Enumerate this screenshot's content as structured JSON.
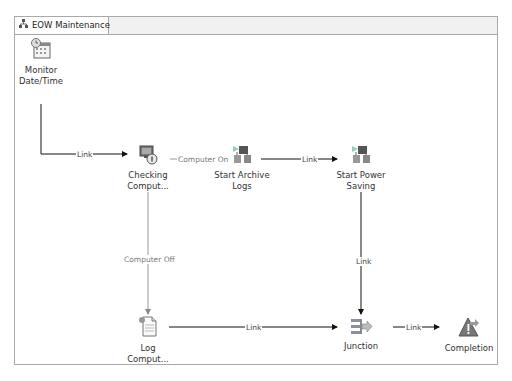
{
  "tab": {
    "title": "EOW Maintenance",
    "icon": "workflow-icon"
  },
  "nodes": [
    {
      "id": "monitor",
      "label_line1": "Monitor",
      "label_line2": "Date/Time",
      "icon": "calendar-clock-icon"
    },
    {
      "id": "checking",
      "label_line1": "Checking",
      "label_line2": "Comput...",
      "icon": "computer-check-icon"
    },
    {
      "id": "archive",
      "label_line1": "Start Archive",
      "label_line2": "Logs",
      "icon": "run-program-icon"
    },
    {
      "id": "power",
      "label_line1": "Start Power",
      "label_line2": "Saving",
      "icon": "run-program-icon"
    },
    {
      "id": "log",
      "label_line1": "Log",
      "label_line2": "Comput...",
      "icon": "log-document-icon"
    },
    {
      "id": "junction",
      "label_line1": "Junction",
      "label_line2": "",
      "icon": "junction-icon"
    },
    {
      "id": "completion",
      "label_line1": "Completion",
      "label_line2": "",
      "icon": "completion-icon"
    }
  ],
  "links": {
    "monitor_to_checking": "Link",
    "checking_to_archive": "Computer On",
    "archive_to_power": "Link",
    "checking_to_log": "Computer Off",
    "power_to_junction": "Link",
    "log_to_junction": "Link",
    "junction_to_completion": "Link"
  }
}
